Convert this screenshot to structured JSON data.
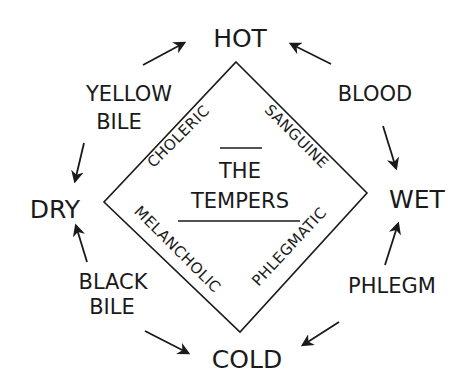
{
  "diagram": {
    "title_line1": "THE",
    "title_line2": "TEMPERS",
    "qualities": {
      "top": "HOT",
      "bottom": "COLD",
      "left": "DRY",
      "right": "WET"
    },
    "humors": {
      "top_left_line1": "YELLOW",
      "top_left_line2": "BILE",
      "top_right": "BLOOD",
      "bottom_left_line1": "BLACK",
      "bottom_left_line2": "BILE",
      "bottom_right": "PHLEGM"
    },
    "temperaments": {
      "top_left": "CHOLERIC",
      "top_right": "SANGUINE",
      "bottom_left": "MELANCHOLIC",
      "bottom_right": "PHLEGMATIC"
    },
    "arrows": [
      {
        "from": "YELLOW BILE",
        "to": "HOT"
      },
      {
        "from": "BLOOD",
        "to": "HOT"
      },
      {
        "from": "YELLOW BILE",
        "to": "DRY"
      },
      {
        "from": "BLOOD",
        "to": "WET"
      },
      {
        "from": "BLACK BILE",
        "to": "DRY"
      },
      {
        "from": "PHLEGM",
        "to": "WET"
      },
      {
        "from": "BLACK BILE",
        "to": "COLD"
      },
      {
        "from": "PHLEGM",
        "to": "COLD"
      }
    ],
    "colors": {
      "ink": "#1a1a1a",
      "background": "#ffffff"
    }
  }
}
